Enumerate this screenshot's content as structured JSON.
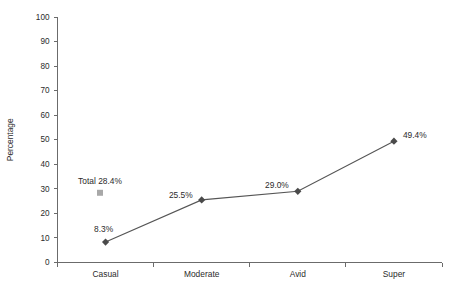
{
  "chart_data": {
    "type": "line",
    "title": "",
    "subtitle": "",
    "xlabel": "",
    "ylabel": "Percentage",
    "categories": [
      "Casual",
      "Moderate",
      "Avid",
      "Super"
    ],
    "values": [
      8.3,
      29.0,
      25.5,
      49.4
    ],
    "series": [
      {
        "name": "Percentage",
        "values": [
          8.3,
          25.5,
          29.0,
          49.4
        ],
        "point_labels": [
          "8.3%",
          "25.5%",
          "29.0%",
          "49.4%"
        ],
        "marker": "diamond",
        "marker_color": "#4a4a4a",
        "line_color": "#555555"
      }
    ],
    "ylim": [
      0,
      100
    ],
    "yticks": [
      0,
      10,
      20,
      30,
      40,
      50,
      60,
      70,
      80,
      90,
      100
    ],
    "ytick_labels": [
      "0",
      "10",
      "20",
      "30",
      "40",
      "50",
      "60",
      "70",
      "80",
      "90",
      "100"
    ],
    "grid": false,
    "legend": false,
    "legend_position": "none",
    "annotations": [
      {
        "name": "total-annotation",
        "text": "Total 28.4%",
        "value": 28.4,
        "marker": "square",
        "marker_color": "#a8a8a8"
      }
    ],
    "colors": {
      "axis": "#6b6b6b",
      "text": "#2b2b2b",
      "line": "#555555",
      "marker": "#4a4a4a",
      "total_marker": "#a8a8a8",
      "background": "#ffffff"
    }
  }
}
